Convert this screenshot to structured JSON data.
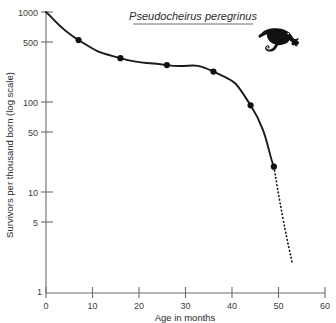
{
  "figure": {
    "width": 336,
    "height": 323,
    "background": "#ffffff",
    "ink_color": "#1a1a1a",
    "axis_color": "#6b6b6b"
  },
  "illustration": {
    "name": "ringtail-possum-silhouette",
    "description": "black silhouette of a ringtail possum with curled prehensile tail",
    "color": "#111111"
  },
  "chart_data": {
    "type": "line",
    "title": "Pseudocheirus peregrinus",
    "title_style": "italic-underlined",
    "subtitle": "",
    "xlabel": "Age in months",
    "ylabel": "Survivors per thousand born (log scale)",
    "yscale": "log",
    "xscale": "linear",
    "xlim": [
      0,
      60
    ],
    "ylim": [
      1,
      1000
    ],
    "grid": false,
    "legend": null,
    "xticks": [
      0,
      10,
      20,
      30,
      40,
      50,
      60
    ],
    "xtick_labels": [
      "0",
      "10",
      "20",
      "30",
      "40",
      "50",
      "60"
    ],
    "yticks": [
      1,
      5,
      10,
      50,
      100,
      500,
      1000
    ],
    "ytick_labels": [
      "1",
      "5",
      "10",
      "50",
      "100",
      "500",
      "1000"
    ],
    "series": [
      {
        "name": "Survivorship curve (observed)",
        "style": "solid",
        "markers": true,
        "x": [
          0,
          7,
          16,
          26,
          36,
          44,
          49
        ],
        "values": [
          1000,
          500,
          320,
          270,
          230,
          100,
          22
        ]
      },
      {
        "name": "Survivorship curve (extrapolated)",
        "style": "dotted",
        "markers": false,
        "x": [
          49,
          51,
          53
        ],
        "values": [
          22,
          6,
          2
        ]
      }
    ],
    "marker_points": [
      {
        "x": 7,
        "y": 500
      },
      {
        "x": 16,
        "y": 320
      },
      {
        "x": 26,
        "y": 270
      },
      {
        "x": 36,
        "y": 230
      },
      {
        "x": 44,
        "y": 100
      },
      {
        "x": 49,
        "y": 22
      }
    ]
  }
}
